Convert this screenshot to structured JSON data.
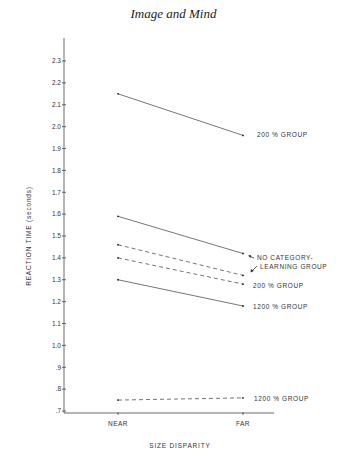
{
  "page": {
    "header": "Image and Mind"
  },
  "chart_data": {
    "type": "line",
    "title": "",
    "xlabel": "SIZE DISPARITY",
    "ylabel": "REACTION TIME (seconds)",
    "categories": [
      "NEAR",
      "FAR"
    ],
    "yticks": [
      "2.3",
      "2.2",
      "2.1",
      "2.0",
      "1.9",
      "1.8",
      "1.7",
      "1.6",
      "1.5",
      "1.4",
      "1.3",
      "1.2",
      "1.1",
      "1.0",
      ".9",
      ".8",
      ".7"
    ],
    "ylim": [
      0.7,
      2.3
    ],
    "grid": false,
    "series": [
      {
        "name": "200% GROUP",
        "style": "solid",
        "values": [
          2.15,
          1.96
        ],
        "label": "200 %  GROUP"
      },
      {
        "name": "NO CATEGORY-LEARNING GROUP (solid)",
        "style": "solid",
        "values": [
          1.59,
          1.42
        ]
      },
      {
        "name": "NO CATEGORY-LEARNING GROUP (dashed)",
        "style": "dashed",
        "values": [
          1.46,
          1.32
        ]
      },
      {
        "name": "200% GROUP (dashed)",
        "style": "dashed",
        "values": [
          1.4,
          1.28
        ],
        "label": "200 %  GROUP"
      },
      {
        "name": "1200% GROUP",
        "style": "solid",
        "values": [
          1.3,
          1.18
        ],
        "label": "1200 %  GROUP"
      },
      {
        "name": "1200% GROUP (dashed)",
        "style": "dashed",
        "values": [
          0.75,
          0.76
        ],
        "label": "1200 %  GROUP"
      }
    ],
    "annotations": {
      "ncl_line1": "NO  CATEGORY-",
      "ncl_line2": "LEARNING  GROUP"
    }
  }
}
